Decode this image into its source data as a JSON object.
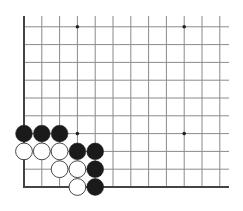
{
  "diagram": {
    "type": "go-board-partial",
    "corner": "bottom-left",
    "colors": {
      "background": "#ffffff",
      "line": "#8a8a8a",
      "edge": "#444444",
      "black_stone": "#1a1a1a",
      "white_stone": "#ffffff",
      "white_stroke": "#333333",
      "star": "#222222"
    },
    "grid": {
      "origin_x": 24,
      "origin_y": 187,
      "spacing": 17.8,
      "cols": 12,
      "rows": 10,
      "right_extent": 229,
      "top_extent": 16
    },
    "star_points": [
      {
        "col": 3,
        "row": 9
      },
      {
        "col": 9,
        "row": 9
      },
      {
        "col": 3,
        "row": 3
      },
      {
        "col": 9,
        "row": 3
      }
    ],
    "stones": [
      {
        "color": "black",
        "col": 0,
        "row": 3
      },
      {
        "color": "black",
        "col": 1,
        "row": 3
      },
      {
        "color": "black",
        "col": 2,
        "row": 3
      },
      {
        "color": "white",
        "col": 0,
        "row": 2
      },
      {
        "color": "white",
        "col": 1,
        "row": 2
      },
      {
        "color": "white",
        "col": 2,
        "row": 2
      },
      {
        "color": "black",
        "col": 3,
        "row": 2
      },
      {
        "color": "black",
        "col": 4,
        "row": 2
      },
      {
        "color": "white",
        "col": 2,
        "row": 1
      },
      {
        "color": "white",
        "col": 3,
        "row": 1
      },
      {
        "color": "black",
        "col": 4,
        "row": 1
      },
      {
        "color": "white",
        "col": 3,
        "row": 0
      },
      {
        "color": "black",
        "col": 4,
        "row": 0
      }
    ]
  }
}
